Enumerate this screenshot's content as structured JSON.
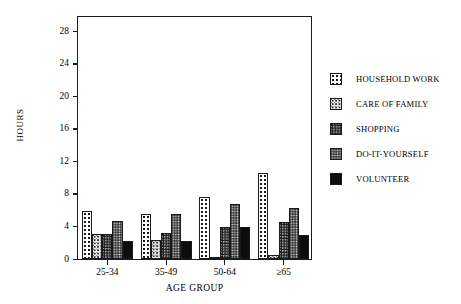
{
  "chart_data": {
    "type": "bar",
    "title": "",
    "xlabel": "AGE GROUP",
    "ylabel": "HOURS",
    "categories": [
      "25-34",
      "35-49",
      "50-64",
      "≥65"
    ],
    "yticks": [
      0,
      4,
      8,
      12,
      16,
      20,
      24,
      28
    ],
    "ylim": [
      0,
      30
    ],
    "grid": false,
    "legend_position": "right",
    "series": [
      {
        "name": "HOUSEHOLD WORK",
        "values": [
          5.9,
          5.5,
          7.6,
          10.6
        ]
      },
      {
        "name": "CARE OF FAMILY",
        "values": [
          3.1,
          2.3,
          0.2,
          0.5
        ]
      },
      {
        "name": "SHOPPING",
        "values": [
          3.1,
          3.2,
          3.9,
          4.5
        ]
      },
      {
        "name": "DO-IT-YOURSELF",
        "values": [
          4.7,
          5.5,
          6.8,
          6.3
        ]
      },
      {
        "name": "VOLUNTEER",
        "values": [
          2.2,
          2.2,
          3.9,
          2.9
        ]
      }
    ]
  },
  "legend": {
    "items": [
      {
        "label": "HOUSEHOLD WORK"
      },
      {
        "label": "CARE OF FAMILY"
      },
      {
        "label": "SHOPPING"
      },
      {
        "label": "DO-IT-YOURSELF"
      },
      {
        "label": "VOLUNTEER"
      }
    ]
  },
  "colors": {
    "axis": "#1a1a1a",
    "background": "#ffffff",
    "series_tones": [
      "#fdfdfd",
      "#f0f0f0",
      "#a8a8a8",
      "#3a3a3a",
      "#0d0d0d"
    ]
  }
}
